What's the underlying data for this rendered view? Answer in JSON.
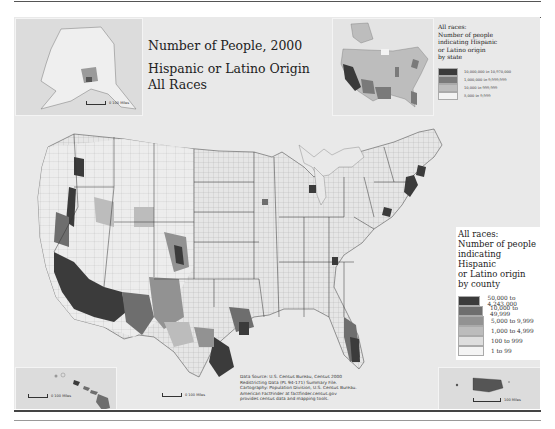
{
  "map": {
    "title_line1": "Number of People, 2000",
    "title_line2": "Hispanic or Latino Origin",
    "title_line3": "All Races"
  },
  "state_legend": {
    "heading_line1": "All races:",
    "heading_line2": "Number of people",
    "heading_line3": "indicating Hispanic",
    "heading_line4": "or Latino origin",
    "heading_line5": "by state",
    "classes": [
      {
        "label": "10,000,000 to 10,970,000",
        "color": "#3a3a3a"
      },
      {
        "label": "1,000,000 to 9,999,999",
        "color": "#7a7a7a"
      },
      {
        "label": "10,000 to 999,999",
        "color": "#bdbdbd"
      },
      {
        "label": "5,000 to 9,999",
        "color": "#f3f3f3"
      }
    ]
  },
  "county_legend": {
    "heading_line1": "All races:",
    "heading_line2": "Number of people",
    "heading_line3": "indicating Hispanic",
    "heading_line4": "or Latino origin",
    "heading_line5": "by county",
    "classes": [
      {
        "label": "50,000 to 4,243,000",
        "color": "#3b3b3b"
      },
      {
        "label": "10,000 to 49,999",
        "color": "#6e6e6e"
      },
      {
        "label": "5,000 to 9,999",
        "color": "#929292"
      },
      {
        "label": "1,000 to 4,999",
        "color": "#bcbcbc"
      },
      {
        "label": "100 to 999",
        "color": "#dedede"
      },
      {
        "label": "1 to 99",
        "color": "#f4f4f4"
      }
    ]
  },
  "source_note": {
    "line1": "Data Source: U.S. Census Bureau, Census 2000",
    "line2": "Redistricting Data (PL 94-171) Summary File.",
    "line3": "Cartography: Population Division, U.S. Census Bureau.",
    "line4": "American FactFinder at factfinder.census.gov",
    "line5": "provides census data and mapping tools."
  },
  "scale_bars": {
    "alaska": "0   100 Miles",
    "hawaii": "0   100 Miles",
    "conus": "0   100 Miles",
    "puerto_rico": "100 Miles"
  },
  "colors": {
    "background": "#e9e9e9",
    "land_light": "#f2f2f2",
    "water": "#e4e4e4"
  }
}
